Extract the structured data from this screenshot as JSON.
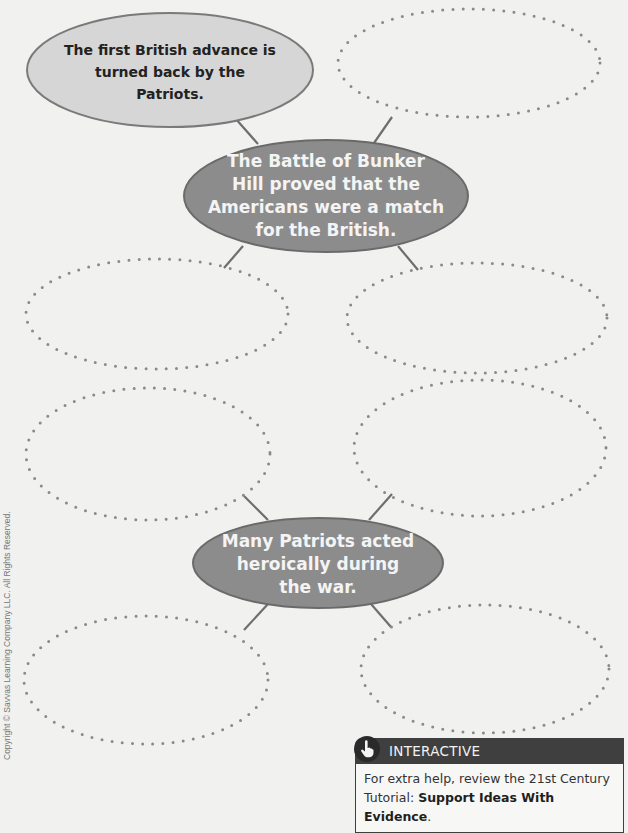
{
  "diagram": {
    "main_ideas": [
      {
        "text": "The Battle of Bunker Hill proved that the Americans were a match for the British.",
        "lines": [
          "The Battle of Bunker",
          "Hill proved that the",
          "Americans were a match",
          "for the British."
        ]
      },
      {
        "text": "Many Patriots acted heroically during the war.",
        "lines": [
          "Many Patriots acted",
          "heroically during",
          "the war."
        ]
      }
    ],
    "details": [
      {
        "text": "The first British advance is turned back by the Patriots.",
        "lines": [
          "The first British advance is",
          "turned back by the Patriots."
        ],
        "filled": true
      },
      {
        "text": "",
        "filled": false
      },
      {
        "text": "",
        "filled": false
      },
      {
        "text": "",
        "filled": false
      },
      {
        "text": "",
        "filled": false
      },
      {
        "text": "",
        "filled": false
      },
      {
        "text": "",
        "filled": false
      },
      {
        "text": "",
        "filled": false
      }
    ]
  },
  "interactive_card": {
    "icon": "hand-pointer-icon",
    "title": "INTERACTIVE",
    "body_prefix": "For extra help, review the 21st Century Tutorial: ",
    "body_bold": "Support Ideas With Evidence",
    "body_suffix": "."
  },
  "copyright": "Copyright © Savvas Learning Company LLC. All Rights Reserved.",
  "colors": {
    "background": "#f1f1f0",
    "main_oval_fill": "#8c8c8c",
    "detail_oval_fill": "#d6d6d6",
    "connector": "#6e6e6e",
    "dots": "#8a8a8a",
    "card_header": "#3f3f3f"
  }
}
